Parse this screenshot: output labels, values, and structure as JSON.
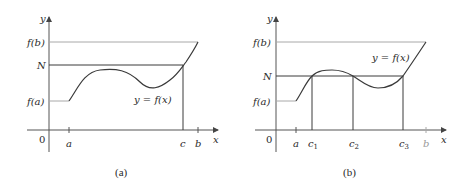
{
  "figure": {
    "panels": [
      {
        "id": "a",
        "caption": "(a)",
        "y_axis_label": "y",
        "x_axis_label": "x",
        "origin_label": "0",
        "y_labels": {
          "fb": "f(b)",
          "N": "N",
          "fa": "f(a)"
        },
        "x_labels": {
          "a": "a",
          "c": "c",
          "b": "b"
        },
        "curve_label": "y = f(x)"
      },
      {
        "id": "b",
        "caption": "(b)",
        "y_axis_label": "y",
        "x_axis_label": "x",
        "origin_label": "0",
        "y_labels": {
          "fb": "f(b)",
          "N": "N",
          "fa": "f(a)"
        },
        "x_labels": {
          "a": "a",
          "c1": "c",
          "c1_sub": "1",
          "c2": "c",
          "c2_sub": "2",
          "c3": "c",
          "c3_sub": "3",
          "b": "b"
        },
        "curve_label": "y = f(x)"
      }
    ]
  }
}
